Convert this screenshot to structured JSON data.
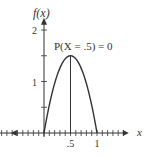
{
  "chart_data": {
    "type": "line",
    "title": "",
    "function": "f(x) = 6x(1 - x)",
    "series": [
      {
        "name": "f(x)",
        "x": [
          0,
          0.1,
          0.2,
          0.3,
          0.4,
          0.5,
          0.6,
          0.7,
          0.8,
          0.9,
          1.0
        ],
        "y": [
          0,
          0.54,
          0.96,
          1.26,
          1.44,
          1.5,
          1.44,
          1.26,
          0.96,
          0.54,
          0
        ]
      }
    ],
    "xlabel": "x",
    "ylabel": "f(x)",
    "xlim": [
      -0.85,
      1.6
    ],
    "ylim": [
      0,
      2.2
    ],
    "x_ticks": [
      -0.8,
      -0.7,
      -0.6,
      -0.5,
      -0.4,
      -0.3,
      -0.2,
      -0.1,
      0,
      0.1,
      0.2,
      0.3,
      0.4,
      0.5,
      0.6,
      0.7,
      0.8,
      0.9,
      1.0,
      1.1,
      1.2,
      1.3,
      1.4,
      1.5
    ],
    "x_tick_labels": [
      {
        "value": 0.5,
        "label": ".5"
      },
      {
        "value": 1,
        "label": "1"
      }
    ],
    "y_ticks": [
      0.5,
      1,
      1.5,
      2
    ],
    "y_tick_labels": [
      {
        "value": 1,
        "label": "1"
      },
      {
        "value": 2,
        "label": "2"
      }
    ],
    "vertical_line": {
      "x": 0.5,
      "from": 0,
      "to": 1.5
    },
    "annotation": "P(X = .5) = 0",
    "grid": false,
    "legend": "none"
  }
}
